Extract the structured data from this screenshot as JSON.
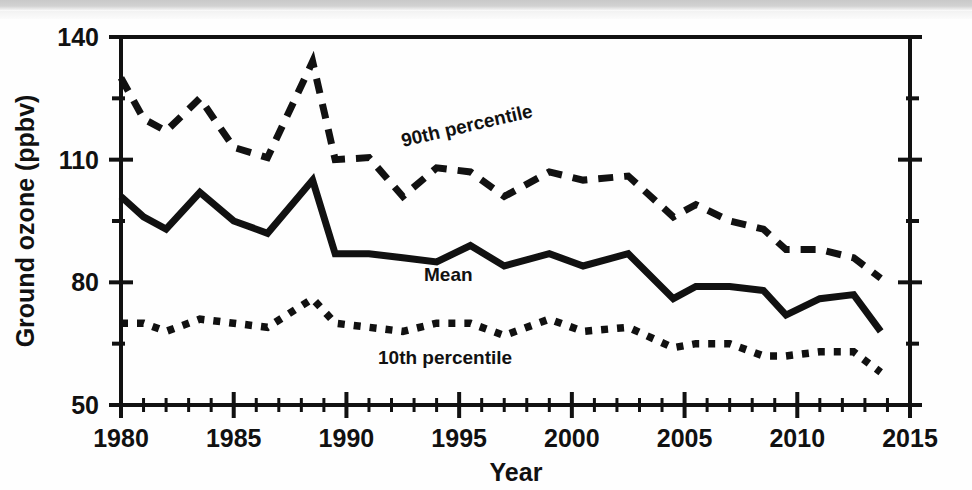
{
  "figure": {
    "background_color": "#fefefe",
    "ink_color": "#111111"
  },
  "axes": {
    "y_title": "Ground ozone (ppbv)",
    "x_title": "Year",
    "y_ticks": [
      "140",
      "110",
      "80",
      "50"
    ],
    "x_ticks": [
      "1980",
      "1985",
      "1990",
      "1995",
      "2000",
      "2005",
      "2010",
      "2015"
    ]
  },
  "labels": {
    "p90": "90th percentile",
    "mean": "Mean",
    "p10": "10th percentile"
  },
  "chart_data": {
    "type": "line",
    "title": "",
    "xlabel": "Year",
    "ylabel": "Ground ozone (ppbv)",
    "xlim": [
      1980,
      2015
    ],
    "ylim": [
      50,
      140
    ],
    "y_major_ticks": [
      50,
      80,
      110,
      140
    ],
    "y_minor_ticks": [
      65,
      95,
      125
    ],
    "x_major_ticks": [
      1980,
      1985,
      1990,
      1995,
      2000,
      2005,
      2010,
      2015
    ],
    "x_minor_tick_step": 1,
    "grid": false,
    "legend": "inline-annotations",
    "x": [
      1980,
      1981,
      1982,
      1983.5,
      1985,
      1986.5,
      1988.5,
      1989.5,
      1991,
      1992.5,
      1994,
      1995.5,
      1997,
      1999,
      2000.5,
      2002.5,
      2004.5,
      2005.5,
      2007,
      2008.5,
      2009.5,
      2011,
      2012.5,
      2013.7
    ],
    "series": [
      {
        "name": "90th percentile",
        "style": "dashed",
        "values": [
          130,
          120,
          117,
          125,
          113,
          110.5,
          134,
          110,
          110.5,
          101,
          108,
          107,
          101,
          107,
          105,
          106,
          96,
          99,
          95,
          93,
          88,
          88,
          86,
          81
        ]
      },
      {
        "name": "Mean",
        "style": "solid",
        "values": [
          101,
          96,
          93,
          102,
          95,
          92,
          105,
          87,
          87,
          86,
          85,
          89,
          84,
          87,
          84,
          87,
          76,
          79,
          79,
          78,
          72,
          76,
          77,
          68
        ]
      },
      {
        "name": "10th percentile",
        "style": "dotted",
        "values": [
          70,
          70,
          68,
          71,
          70,
          69,
          76,
          70,
          69,
          68,
          70,
          70,
          67,
          71,
          68,
          69,
          64,
          65,
          65,
          62,
          62,
          63,
          63,
          58
        ]
      }
    ]
  }
}
